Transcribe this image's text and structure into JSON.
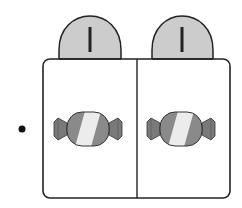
{
  "figure": {
    "bullet": {
      "shape": "dot"
    },
    "container": {
      "compartments": 2,
      "tabs": [
        {
          "label": "I"
        },
        {
          "label": "I"
        }
      ],
      "items": [
        {
          "type": "candy-icon",
          "count": 1
        },
        {
          "type": "candy-icon",
          "count": 1
        }
      ]
    },
    "colors": {
      "outline": "#222222",
      "tab_fill": "#cccccc",
      "candy_dark": "#8a8a8a",
      "candy_light": "#ececec",
      "candy_wrap": "#7a7a7a",
      "background": "#ffffff"
    }
  }
}
